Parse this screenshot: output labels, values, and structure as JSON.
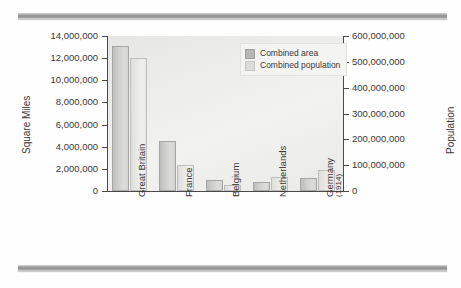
{
  "chart_data": {
    "type": "bar",
    "title": "",
    "subtitle": "",
    "categories": [
      "Great Britain",
      "France",
      "Belgium",
      "Netherlands",
      "Germany"
    ],
    "category_sublabels": [
      "",
      "",
      "",
      "",
      "(1914)"
    ],
    "series": [
      {
        "name": "Combined area",
        "axis": "left",
        "unit": "Square Miles",
        "values": [
          13100000,
          4500000,
          950000,
          800000,
          1200000
        ]
      },
      {
        "name": "Combined population",
        "axis": "right",
        "unit": "Population",
        "values": [
          515000000,
          100000000,
          25000000,
          55000000,
          80000000
        ]
      }
    ],
    "xlabel": "",
    "ylabel": "Square Miles",
    "y2label": "Population",
    "ylim": [
      0,
      14000000
    ],
    "y2lim": [
      0,
      600000000
    ],
    "ytick_labels": [
      "0",
      "2,000,000",
      "4,000,000",
      "6,000,000",
      "8,000,000",
      "10,000,000",
      "12,000,000",
      "14,000,000"
    ],
    "ytick_values": [
      0,
      2000000,
      4000000,
      6000000,
      8000000,
      10000000,
      12000000,
      14000000
    ],
    "y2tick_labels": [
      "0",
      "100,000,000",
      "200,000,000",
      "300,000,000",
      "400,000,000",
      "500,000,000",
      "600,000,000"
    ],
    "y2tick_values": [
      0,
      100000000,
      200000000,
      300000000,
      400000000,
      500000000,
      600000000
    ],
    "grid": false,
    "legend_position": "top-right",
    "colors": {
      "area_bar": "#cfcfcd",
      "population_bar": "#e9e9e7",
      "plot_background": "#ececeb",
      "axis": "#4c4a48",
      "text": "#3a3735",
      "rule": "#8d8d8d"
    }
  },
  "axes": {
    "left_title": "Square Miles",
    "right_title": "Population"
  },
  "legend": {
    "items": [
      {
        "label": "Combined area",
        "swatch": "area"
      },
      {
        "label": "Combined population",
        "swatch": "pop"
      }
    ]
  },
  "decoration": {
    "top_rule": "horizontal-rule",
    "bottom_rule": "horizontal-rule"
  }
}
